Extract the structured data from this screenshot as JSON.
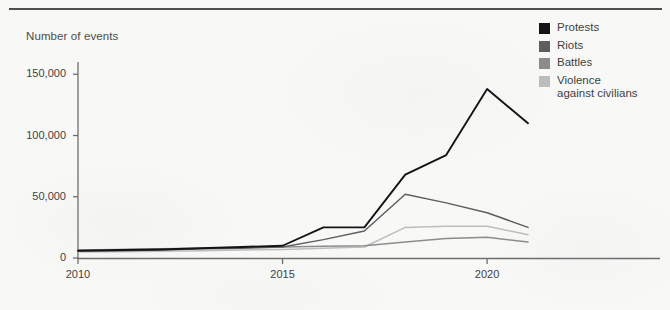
{
  "chart_data": {
    "type": "line",
    "title": "",
    "subtitle": "",
    "ylabel": "Number of events",
    "xlabel": "",
    "x": [
      2010,
      2011,
      2012,
      2013,
      2014,
      2015,
      2016,
      2017,
      2018,
      2019,
      2020,
      2021
    ],
    "xlim": [
      2010,
      2021
    ],
    "ylim": [
      0,
      160000
    ],
    "xticks": [
      2010,
      2015,
      2020
    ],
    "xtick_labels": [
      "2010",
      "2015",
      "2020"
    ],
    "yticks": [
      0,
      50000,
      100000,
      150000
    ],
    "ytick_labels": [
      "0",
      "50,000",
      "100,000",
      "150,000"
    ],
    "grid": false,
    "legend_position": "right",
    "series": [
      {
        "name": "Protests",
        "color": "#141414",
        "values": [
          6000,
          6500,
          7000,
          8000,
          9000,
          10000,
          25000,
          25000,
          68000,
          84000,
          138000,
          110000
        ]
      },
      {
        "name": "Riots",
        "color": "#5e5e5e",
        "values": [
          5500,
          6000,
          6500,
          7500,
          8000,
          9000,
          15000,
          22000,
          52000,
          45000,
          37000,
          25000
        ]
      },
      {
        "name": "Battles",
        "color": "#8c8c8c",
        "values": [
          6500,
          7000,
          7500,
          8000,
          8500,
          9000,
          9500,
          10000,
          13000,
          16000,
          17000,
          13000
        ]
      },
      {
        "name": "Violence against civilians",
        "color": "#bdbdbd",
        "values": [
          5000,
          5200,
          5500,
          6000,
          6500,
          7000,
          8000,
          9000,
          25000,
          26000,
          26000,
          19000
        ]
      }
    ]
  },
  "legend": {
    "items": [
      {
        "label": "Protests",
        "color": "#141414"
      },
      {
        "label": "Riots",
        "color": "#5e5e5e"
      },
      {
        "label": "Battles",
        "color": "#8c8c8c"
      },
      {
        "label": "Violence\nagainst civilians",
        "color": "#bdbdbd"
      }
    ]
  },
  "axis": {
    "line_color": "#6e6e6e",
    "tick_color": "#6e6e6e"
  }
}
